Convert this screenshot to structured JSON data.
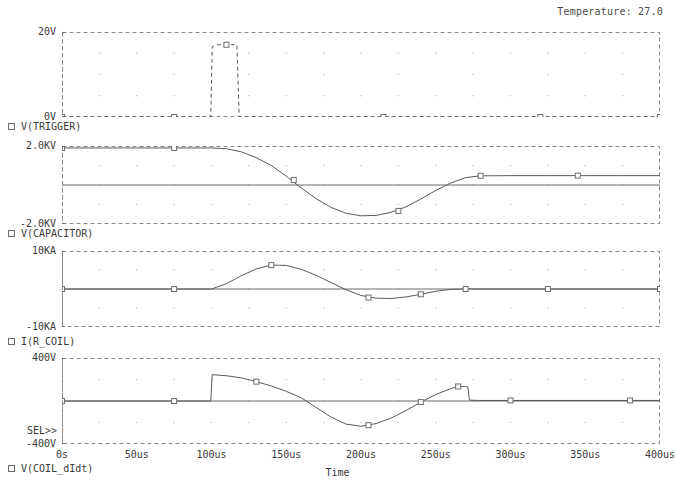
{
  "header": {
    "temperature_label": "Temperature: 27.0"
  },
  "axis": {
    "x_title": "Time",
    "x_ticks": [
      "0s",
      "50us",
      "100us",
      "150us",
      "200us",
      "250us",
      "300us",
      "350us",
      "400us"
    ],
    "x_tick_values": [
      0,
      50,
      100,
      150,
      200,
      250,
      300,
      350,
      400
    ],
    "sel_marker": "SEL>>"
  },
  "panels": [
    {
      "name": "trigger",
      "legend": "V(TRIGGER)",
      "marker_icon": "square-marker-icon",
      "y_top_label": "20V",
      "y_bottom_label": "0V",
      "ylim": [
        0,
        20
      ],
      "line_style": "dashed"
    },
    {
      "name": "capacitor",
      "legend": "V(CAPACITOR)",
      "marker_icon": "square-marker-icon",
      "y_top_label": "2.0KV",
      "y_bottom_label": "-2.0KV",
      "ylim": [
        -2000,
        2000
      ],
      "line_style": "solid"
    },
    {
      "name": "coil-current",
      "legend": "I(R_COIL)",
      "marker_icon": "square-marker-icon",
      "y_top_label": "10KA",
      "y_bottom_label": "-10KA",
      "ylim": [
        -10000,
        10000
      ],
      "line_style": "solid"
    },
    {
      "name": "coil-didt",
      "legend": "V(COIL_dIdt)",
      "marker_icon": "square-marker-icon",
      "y_top_label": "400V",
      "y_bottom_label": "-400V",
      "ylim": [
        -400,
        400
      ],
      "line_style": "solid"
    }
  ],
  "chart_data": {
    "type": "line",
    "title": "",
    "xlabel": "Time",
    "grid": true,
    "legend_position": "below-each-panel",
    "xlim": [
      0,
      400
    ],
    "x_unit": "us",
    "subplots": [
      {
        "name": "V(TRIGGER)",
        "ylabel": "V",
        "ylim": [
          0,
          20
        ],
        "yticks": [
          0,
          20
        ],
        "series": [
          {
            "name": "V(TRIGGER)",
            "x": [
              0,
              50,
              99.5,
              100.5,
              103,
              110,
              117,
              117.8,
              118.5,
              150,
              200,
              250,
              300,
              350,
              400
            ],
            "values": [
              0,
              0,
              0,
              16.5,
              17.0,
              17.0,
              17.0,
              8,
              0,
              0,
              0,
              0,
              0,
              0,
              0
            ],
            "markers_x": [
              0,
              75,
              110,
              215,
              320,
              400
            ],
            "markers_y": [
              0,
              0,
              17.0,
              0,
              0,
              0
            ]
          }
        ]
      },
      {
        "name": "V(CAPACITOR)",
        "ylabel": "KV",
        "ylim": [
          -2000,
          2000
        ],
        "yticks": [
          -2000,
          0,
          2000
        ],
        "series": [
          {
            "name": "V(CAPACITOR)",
            "x": [
              0,
              25,
              50,
              75,
              100,
              110,
              120,
              130,
              140,
              150,
              160,
              170,
              180,
              190,
              200,
              210,
              220,
              230,
              240,
              250,
              260,
              270,
              280,
              300,
              325,
              350,
              375,
              400
            ],
            "values": [
              1900,
              1900,
              1900,
              1900,
              1900,
              1860,
              1700,
              1400,
              1000,
              450,
              -150,
              -700,
              -1150,
              -1450,
              -1580,
              -1560,
              -1400,
              -1120,
              -720,
              -280,
              100,
              380,
              470,
              480,
              480,
              480,
              480,
              480
            ],
            "markers_x": [
              0,
              75,
              155,
              225,
              280,
              345
            ],
            "markers_y": [
              1900,
              1900,
              260,
              -1330,
              470,
              480
            ]
          }
        ]
      },
      {
        "name": "I(R_COIL)",
        "ylabel": "KA",
        "ylim": [
          -10000,
          10000
        ],
        "yticks": [
          -10000,
          0,
          10000
        ],
        "series": [
          {
            "name": "I(R_COIL)",
            "x": [
              0,
              25,
              50,
              75,
              100,
              110,
              120,
              130,
              140,
              150,
              160,
              170,
              180,
              190,
              200,
              210,
              220,
              230,
              240,
              250,
              260,
              270,
              300,
              325,
              350,
              375,
              400
            ],
            "values": [
              0,
              0,
              0,
              0,
              0,
              1400,
              3500,
              5300,
              6300,
              6200,
              5200,
              3600,
              1700,
              -200,
              -1700,
              -2400,
              -2500,
              -2100,
              -1400,
              -600,
              -100,
              0,
              0,
              0,
              0,
              0,
              0
            ],
            "markers_x": [
              0,
              75,
              140,
              205,
              240,
              270,
              325,
              400
            ],
            "markers_y": [
              0,
              0,
              6300,
              -2250,
              -1400,
              0,
              0,
              0
            ]
          }
        ]
      },
      {
        "name": "V(COIL_dIdt)",
        "ylabel": "V",
        "ylim": [
          -400,
          400
        ],
        "yticks": [
          -400,
          400
        ],
        "series": [
          {
            "name": "V(COIL_dIdt)",
            "x": [
              0,
              25,
              50,
              75,
              99.5,
              100.5,
              110,
              120,
              130,
              140,
              150,
              160,
              170,
              180,
              190,
              200,
              210,
              220,
              230,
              240,
              250,
              260,
              265,
              270,
              271.5,
              272.5,
              280,
              300,
              325,
              350,
              375,
              400
            ],
            "values": [
              0,
              0,
              0,
              0,
              0,
              245,
              235,
              215,
              180,
              140,
              90,
              30,
              -60,
              -150,
              -215,
              -235,
              -210,
              -160,
              -90,
              -10,
              60,
              115,
              135,
              135,
              130,
              8,
              5,
              5,
              5,
              5,
              5,
              5
            ],
            "markers_x": [
              0,
              75,
              130,
              205,
              240,
              265,
              300,
              380
            ],
            "markers_y": [
              0,
              0,
              180,
              -225,
              -10,
              135,
              5,
              5
            ]
          }
        ]
      }
    ]
  }
}
